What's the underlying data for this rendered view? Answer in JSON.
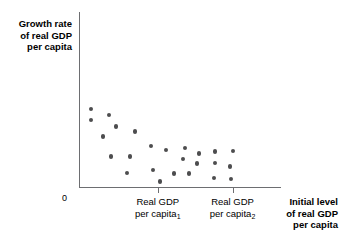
{
  "chart_data": {
    "type": "scatter",
    "title": "",
    "subtitle": "",
    "ylabel": "Growth rate of real GDP per capita",
    "xlabel": "Initial level of real GDP per capita",
    "origin_label": "0",
    "grid": false,
    "legend": "none",
    "axis_color": "#6d6e71",
    "point_color": "#4d4d4f",
    "xlim": [
      0,
      100
    ],
    "ylim": [
      0,
      100
    ],
    "x_ticks": [
      {
        "value": 39,
        "line1": "Real GDP",
        "line2": "per capita",
        "sub": "1"
      },
      {
        "value": 76,
        "line1": "Real GDP",
        "line2": "per capita",
        "sub": "2"
      }
    ],
    "y_axis_title_lines": [
      "Growth rate",
      "of real GDP",
      "per capita"
    ],
    "x_axis_title_lines": [
      "Initial level",
      "of real GDP",
      "per capita"
    ],
    "points": [
      {
        "x": 6.0,
        "y": 62.5
      },
      {
        "x": 6.0,
        "y": 53.4
      },
      {
        "x": 14.9,
        "y": 57.4
      },
      {
        "x": 18.3,
        "y": 48.3
      },
      {
        "x": 11.9,
        "y": 40.3
      },
      {
        "x": 27.7,
        "y": 44.3
      },
      {
        "x": 35.6,
        "y": 33.0
      },
      {
        "x": 43.1,
        "y": 29.5
      },
      {
        "x": 52.5,
        "y": 31.3
      },
      {
        "x": 59.4,
        "y": 26.7
      },
      {
        "x": 67.3,
        "y": 28.4
      },
      {
        "x": 76.2,
        "y": 29.0
      },
      {
        "x": 15.8,
        "y": 24.4
      },
      {
        "x": 25.2,
        "y": 24.4
      },
      {
        "x": 51.5,
        "y": 22.2
      },
      {
        "x": 58.4,
        "y": 18.8
      },
      {
        "x": 67.3,
        "y": 19.3
      },
      {
        "x": 74.8,
        "y": 16.5
      },
      {
        "x": 23.8,
        "y": 11.4
      },
      {
        "x": 36.6,
        "y": 13.6
      },
      {
        "x": 47.0,
        "y": 10.8
      },
      {
        "x": 54.5,
        "y": 10.8
      },
      {
        "x": 66.8,
        "y": 7.4
      },
      {
        "x": 75.3,
        "y": 6.3
      },
      {
        "x": 40.1,
        "y": 4.5
      }
    ]
  }
}
